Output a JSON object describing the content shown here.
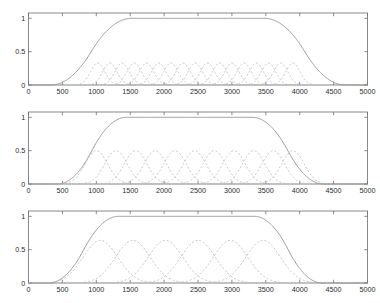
{
  "figure": {
    "background_color": "#ffffff",
    "axis_color": "#6d6d6d",
    "envelope_color": "#8a8a8a",
    "mf_color": "#b9b9b9",
    "width": 380,
    "height": 303
  },
  "chart_data": [
    {
      "type": "line",
      "title": "",
      "xlabel": "",
      "ylabel": "",
      "xlim": [
        0,
        5000
      ],
      "ylim": [
        0,
        1.08
      ],
      "grid": false,
      "legend": null,
      "xticks": [
        0,
        500,
        1000,
        1500,
        2000,
        2500,
        3000,
        3500,
        4000,
        4500,
        5000
      ],
      "xticklabels": [
        "0",
        "500",
        "1000",
        "1500",
        "2000",
        "2500",
        "3000",
        "3500",
        "4000",
        "4500",
        "5000"
      ],
      "yticks": [
        0,
        0.5,
        1
      ],
      "yticklabels": [
        "0",
        "0.5",
        "1"
      ],
      "series": [
        {
          "name": "envelope",
          "style": "solid",
          "kind": "trapezoid-sigmoid",
          "peak": 1.0,
          "rise_start": 330,
          "rise_end": 1520,
          "fall_start": 3480,
          "fall_end": 4670
        },
        {
          "name": "membership-functions",
          "style": "dashed",
          "kind": "gaussian-bells",
          "count": 17,
          "peak": 0.33,
          "sigma": 105,
          "centers": [
            1020,
            1200,
            1380,
            1560,
            1740,
            1920,
            2100,
            2280,
            2460,
            2640,
            2820,
            3000,
            3180,
            3360,
            3540,
            3720,
            3900
          ]
        }
      ]
    },
    {
      "type": "line",
      "title": "",
      "xlabel": "",
      "ylabel": "",
      "xlim": [
        0,
        5000
      ],
      "ylim": [
        0,
        1.08
      ],
      "grid": false,
      "legend": null,
      "xticks": [
        0,
        500,
        1000,
        1500,
        2000,
        2500,
        3000,
        3500,
        4000,
        4500,
        5000
      ],
      "xticklabels": [
        "0",
        "500",
        "1000",
        "1500",
        "2000",
        "2500",
        "3000",
        "3500",
        "4000",
        "4500",
        "5000"
      ],
      "yticks": [
        0,
        0.5,
        1
      ],
      "yticklabels": [
        "0",
        "0.5",
        "1"
      ],
      "series": [
        {
          "name": "envelope",
          "style": "solid",
          "kind": "trapezoid-sigmoid",
          "peak": 1.0,
          "rise_start": 430,
          "rise_end": 1440,
          "fall_start": 3300,
          "fall_end": 4350
        },
        {
          "name": "membership-functions",
          "style": "dashed",
          "kind": "gaussian-bells",
          "count": 11,
          "peak": 0.5,
          "sigma": 165,
          "centers": [
            1000,
            1290,
            1580,
            1870,
            2160,
            2450,
            2740,
            3030,
            3320,
            3610,
            3900
          ]
        }
      ]
    },
    {
      "type": "line",
      "title": "",
      "xlabel": "",
      "ylabel": "",
      "xlim": [
        0,
        5000
      ],
      "ylim": [
        0,
        1.08
      ],
      "grid": false,
      "legend": null,
      "xticks": [
        0,
        500,
        1000,
        1500,
        2000,
        2500,
        3000,
        3500,
        4000,
        4500,
        5000
      ],
      "xticklabels": [
        "0",
        "500",
        "1000",
        "1500",
        "2000",
        "2500",
        "3000",
        "3500",
        "4000",
        "4500",
        "5000"
      ],
      "yticks": [
        0,
        0.5,
        1
      ],
      "yticklabels": [
        "0",
        "0.5",
        "1"
      ],
      "series": [
        {
          "name": "envelope",
          "style": "solid",
          "kind": "trapezoid-sigmoid",
          "peak": 1.0,
          "rise_start": 300,
          "rise_end": 1330,
          "fall_start": 3330,
          "fall_end": 4330
        },
        {
          "name": "membership-functions",
          "style": "dashed",
          "kind": "gaussian-bells",
          "count": 6,
          "peak": 0.64,
          "sigma": 255,
          "centers": [
            1060,
            1540,
            2020,
            2500,
            2980,
            3460
          ]
        }
      ]
    }
  ]
}
